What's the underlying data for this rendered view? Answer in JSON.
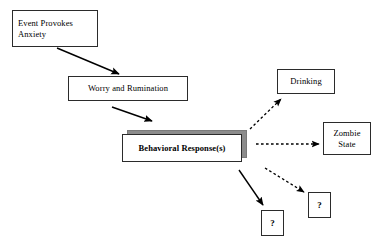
{
  "diagram": {
    "background_color": "#ffffff",
    "line_color": "#000000",
    "shadow_color": "#8c8c8c",
    "nodes": [
      {
        "id": "event",
        "label": "Event Provokes Anxiety",
        "x": 12,
        "y": 10,
        "w": 86,
        "h": 37,
        "style": "plain-left"
      },
      {
        "id": "worry",
        "label": "Worry and Rumination",
        "x": 68,
        "y": 76,
        "w": 120,
        "h": 25,
        "style": "plain"
      },
      {
        "id": "behavioral",
        "label": "Behavioral Response(s)",
        "x": 122,
        "y": 134,
        "w": 120,
        "h": 28,
        "style": "stacked"
      },
      {
        "id": "drinking",
        "label": "Drinking",
        "x": 277,
        "y": 69,
        "w": 58,
        "h": 25,
        "style": "plain"
      },
      {
        "id": "zombie",
        "label": "Zombie State",
        "x": 323,
        "y": 122,
        "w": 48,
        "h": 33,
        "style": "plain"
      },
      {
        "id": "unknown1",
        "label": "?",
        "x": 261,
        "y": 210,
        "w": 23,
        "h": 26,
        "style": "plain"
      },
      {
        "id": "unknown2",
        "label": "?",
        "x": 308,
        "y": 192,
        "w": 23,
        "h": 26,
        "style": "plain"
      }
    ],
    "edges": [
      {
        "id": "event-to-worry",
        "from": "event",
        "to": "worry",
        "kind": "solid",
        "x1": 57,
        "y1": 48,
        "x2": 119,
        "y2": 74
      },
      {
        "id": "worry-to-behavioral",
        "from": "worry",
        "to": "behavioral",
        "kind": "solid",
        "x1": 112,
        "y1": 107,
        "x2": 152,
        "y2": 121
      },
      {
        "id": "behavioral-to-drinking",
        "from": "behavioral",
        "to": "drinking",
        "kind": "dashed",
        "x1": 250,
        "y1": 128,
        "x2": 282,
        "y2": 98
      },
      {
        "id": "behavioral-to-zombie",
        "from": "behavioral",
        "to": "zombie",
        "kind": "dashed",
        "x1": 256,
        "y1": 144,
        "x2": 320,
        "y2": 144
      },
      {
        "id": "behavioral-to-unknown1",
        "from": "behavioral",
        "to": "unknown1",
        "kind": "solid",
        "x1": 239,
        "y1": 170,
        "x2": 263,
        "y2": 206
      },
      {
        "id": "behavioral-to-unknown2",
        "from": "behavioral",
        "to": "unknown2",
        "kind": "dashed",
        "x1": 265,
        "y1": 168,
        "x2": 305,
        "y2": 193
      }
    ]
  }
}
